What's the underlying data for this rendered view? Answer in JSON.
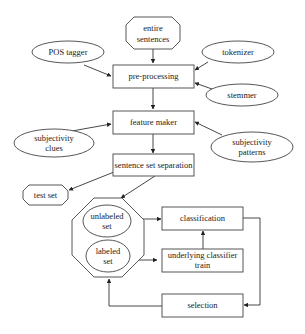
{
  "diagram": {
    "background": "#ffffff",
    "stroke_color": "#444444",
    "nodes": {
      "entire_sentences": {
        "line1": "entire",
        "line2": "sentences",
        "shape": "octagon"
      },
      "pos_tagger": {
        "label": "POS tagger",
        "shape": "ellipse"
      },
      "tokenizer": {
        "label": "tokenizer",
        "shape": "ellipse"
      },
      "stemmer": {
        "label": "stemmer",
        "shape": "ellipse"
      },
      "pre_processing": {
        "label": "pre-processing",
        "shape": "rectangle"
      },
      "feature_maker": {
        "label": "feature maker",
        "shape": "rectangle"
      },
      "subjectivity_clues": {
        "line1": "subjectivity",
        "line2": "clues",
        "shape": "ellipse"
      },
      "subjectivity_patterns": {
        "line1": "subjectivity",
        "line2": "patterns",
        "shape": "ellipse"
      },
      "sentence_set_separation": {
        "label": "sentence set separation",
        "shape": "rectangle"
      },
      "test_set": {
        "label": "test set",
        "shape": "octagon"
      },
      "set_container": {
        "shape": "octagon"
      },
      "unlabeled_set": {
        "line1": "unlabeled",
        "line2": "set",
        "shape": "ellipse"
      },
      "labeled_set": {
        "line1": "labeled",
        "line2": "set",
        "shape": "ellipse"
      },
      "classification": {
        "label": "classification",
        "shape": "rectangle"
      },
      "underlying_classifier_train": {
        "line1": "underlying classifier",
        "line2": "train",
        "shape": "rectangle"
      },
      "selection": {
        "label": "selection",
        "shape": "rectangle"
      }
    },
    "edges": [
      {
        "from": "entire sentences",
        "to": "pre-processing"
      },
      {
        "from": "POS tagger",
        "to": "pre-processing"
      },
      {
        "from": "tokenizer",
        "to": "pre-processing"
      },
      {
        "from": "stemmer",
        "to": "pre-processing"
      },
      {
        "from": "pre-processing",
        "to": "feature maker"
      },
      {
        "from": "subjectivity clues",
        "to": "feature maker"
      },
      {
        "from": "subjectivity patterns",
        "to": "feature maker"
      },
      {
        "from": "feature maker",
        "to": "sentence set separation"
      },
      {
        "from": "sentence set separation",
        "to": "test set"
      },
      {
        "from": "sentence set separation",
        "to": "set container"
      },
      {
        "from": "unlabeled set",
        "to": "classification"
      },
      {
        "from": "labeled set",
        "to": "underlying classifier train"
      },
      {
        "from": "underlying classifier train",
        "to": "classification"
      },
      {
        "from": "classification",
        "to": "selection"
      },
      {
        "from": "selection",
        "to": "set container"
      }
    ]
  }
}
